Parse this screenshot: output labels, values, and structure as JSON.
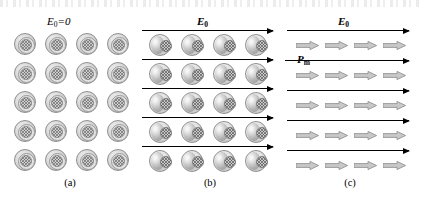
{
  "figure": {
    "width": 421,
    "height": 200,
    "background": "#ffffff",
    "ink_color": "#000000",
    "atom_fill": "#dcdcdc",
    "atom_outline": "#8f8f8f",
    "dipole_arrow_fill": "#c8c8c8",
    "dipole_arrow_outline": "#8a8a8a"
  },
  "panels": [
    {
      "id": "a",
      "caption": "(a)",
      "heading": {
        "symbol": "E",
        "subscript": "0",
        "suffix": "=0",
        "bold": false
      },
      "field_lines": 0,
      "atom_rows": 5,
      "atom_cols": 4,
      "atom_type": "unpolarized"
    },
    {
      "id": "b",
      "caption": "(b)",
      "heading": {
        "symbol": "E",
        "subscript": "0",
        "suffix": "",
        "bold": true
      },
      "field_lines": 5,
      "atom_rows": 5,
      "atom_cols": 4,
      "atom_type": "polarized"
    },
    {
      "id": "c",
      "caption": "(c)",
      "heading": {
        "symbol": "E",
        "subscript": "0",
        "suffix": "",
        "bold": true
      },
      "field_lines": 5,
      "arrow_rows": 5,
      "arrow_cols": 4,
      "dipole_label": {
        "symbol": "P",
        "subscript": "m"
      }
    }
  ],
  "labels": {
    "panel_a_heading": "E0=0",
    "panel_b_heading": "E0",
    "panel_c_heading": "E0",
    "dipole_moment": "Pm",
    "caption_a": "(a)",
    "caption_b": "(b)",
    "caption_c": "(c)"
  }
}
